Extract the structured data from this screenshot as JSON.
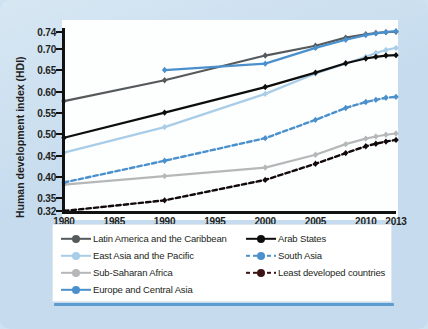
{
  "figure": {
    "background_color": "#c6dcee",
    "plot_background_color": "#fdfefe"
  },
  "chart_data": {
    "type": "line",
    "title": "",
    "xlabel": "",
    "ylabel": "Human development index (HDI)",
    "xlim": [
      1980,
      2013
    ],
    "ylim": [
      0.32,
      0.745
    ],
    "grid": false,
    "legend_position": "bottom",
    "xticks": [
      1980,
      1985,
      1990,
      1995,
      2000,
      2005,
      2010,
      2013
    ],
    "yticks": [
      0.32,
      0.35,
      0.4,
      0.45,
      0.5,
      0.55,
      0.6,
      0.65,
      0.7,
      0.74
    ],
    "ytick_labels": [
      "0.32",
      "0.35",
      "0.40",
      "0.45",
      "0.50",
      "0.55",
      "0.60",
      "0.65",
      "0.70",
      "0.74"
    ],
    "xtick_labels": [
      "1980",
      "1985",
      "1990",
      "1995",
      "2000",
      "2005",
      "2010",
      "2013"
    ],
    "series": [
      {
        "name": "Latin America and the Caribbean",
        "color": "#555a5d",
        "style": "solid",
        "marker": "diamond",
        "x": [
          1980,
          1990,
          2000,
          2005,
          2008,
          2010,
          2011,
          2012,
          2013
        ],
        "y": [
          0.578,
          0.627,
          0.685,
          0.708,
          0.727,
          0.735,
          0.738,
          0.74,
          0.741
        ]
      },
      {
        "name": "East Asia and the Pacific",
        "color": "#a8cde8",
        "style": "solid",
        "marker": "diamond",
        "x": [
          1980,
          1990,
          2000,
          2005,
          2008,
          2010,
          2011,
          2012,
          2013
        ],
        "y": [
          0.457,
          0.517,
          0.595,
          0.643,
          0.666,
          0.682,
          0.691,
          0.698,
          0.703
        ]
      },
      {
        "name": "Sub-Saharan Africa",
        "color": "#b6b7b9",
        "style": "solid",
        "marker": "diamond",
        "x": [
          1980,
          1990,
          2000,
          2005,
          2008,
          2010,
          2011,
          2012,
          2013
        ],
        "y": [
          0.382,
          0.402,
          0.422,
          0.452,
          0.477,
          0.49,
          0.495,
          0.499,
          0.502
        ]
      },
      {
        "name": "Europe and Central Asia",
        "color": "#4a90cd",
        "style": "solid",
        "marker": "diamond",
        "x": [
          1990,
          2000,
          2005,
          2008,
          2010,
          2011,
          2012,
          2013
        ],
        "y": [
          0.651,
          0.666,
          0.703,
          0.722,
          0.733,
          0.737,
          0.74,
          0.742
        ]
      },
      {
        "name": "Arab States",
        "color": "#0d0d0d",
        "style": "solid",
        "marker": "diamond",
        "x": [
          1980,
          1990,
          2000,
          2005,
          2008,
          2010,
          2011,
          2012,
          2013
        ],
        "y": [
          0.492,
          0.551,
          0.611,
          0.645,
          0.667,
          0.678,
          0.682,
          0.685,
          0.686
        ]
      },
      {
        "name": "South Asia",
        "color": "#4a90cd",
        "style": "dashed",
        "marker": "diamond",
        "x": [
          1980,
          1990,
          2000,
          2005,
          2008,
          2010,
          2011,
          2012,
          2013
        ],
        "y": [
          0.387,
          0.438,
          0.491,
          0.534,
          0.562,
          0.576,
          0.581,
          0.586,
          0.588
        ]
      },
      {
        "name": "Least developed countries",
        "color": "#120a0a",
        "style": "dashed",
        "marker": "diamond",
        "x": [
          1980,
          1990,
          2000,
          2005,
          2008,
          2010,
          2011,
          2012,
          2013
        ],
        "y": [
          0.32,
          0.345,
          0.393,
          0.431,
          0.456,
          0.472,
          0.478,
          0.483,
          0.487
        ]
      }
    ]
  },
  "legend": {
    "columns": [
      {
        "items": [
          {
            "label": "Latin America and the Caribbean",
            "color": "#555a5d",
            "style": "solid"
          },
          {
            "label": "East Asia and the Pacific",
            "color": "#a8cde8",
            "style": "solid"
          },
          {
            "label": "Sub-Saharan Africa",
            "color": "#b6b7b9",
            "style": "solid"
          },
          {
            "label": "Europe and Central Asia",
            "color": "#4a90cd",
            "style": "solid"
          }
        ]
      },
      {
        "items": [
          {
            "label": "Arab States",
            "color": "#0d0d0d",
            "style": "solid"
          },
          {
            "label": "South Asia",
            "color": "#4a90cd",
            "style": "dashed"
          },
          {
            "label": "Least developed countries",
            "color": "#3a1414",
            "style": "dashed"
          }
        ]
      }
    ]
  }
}
